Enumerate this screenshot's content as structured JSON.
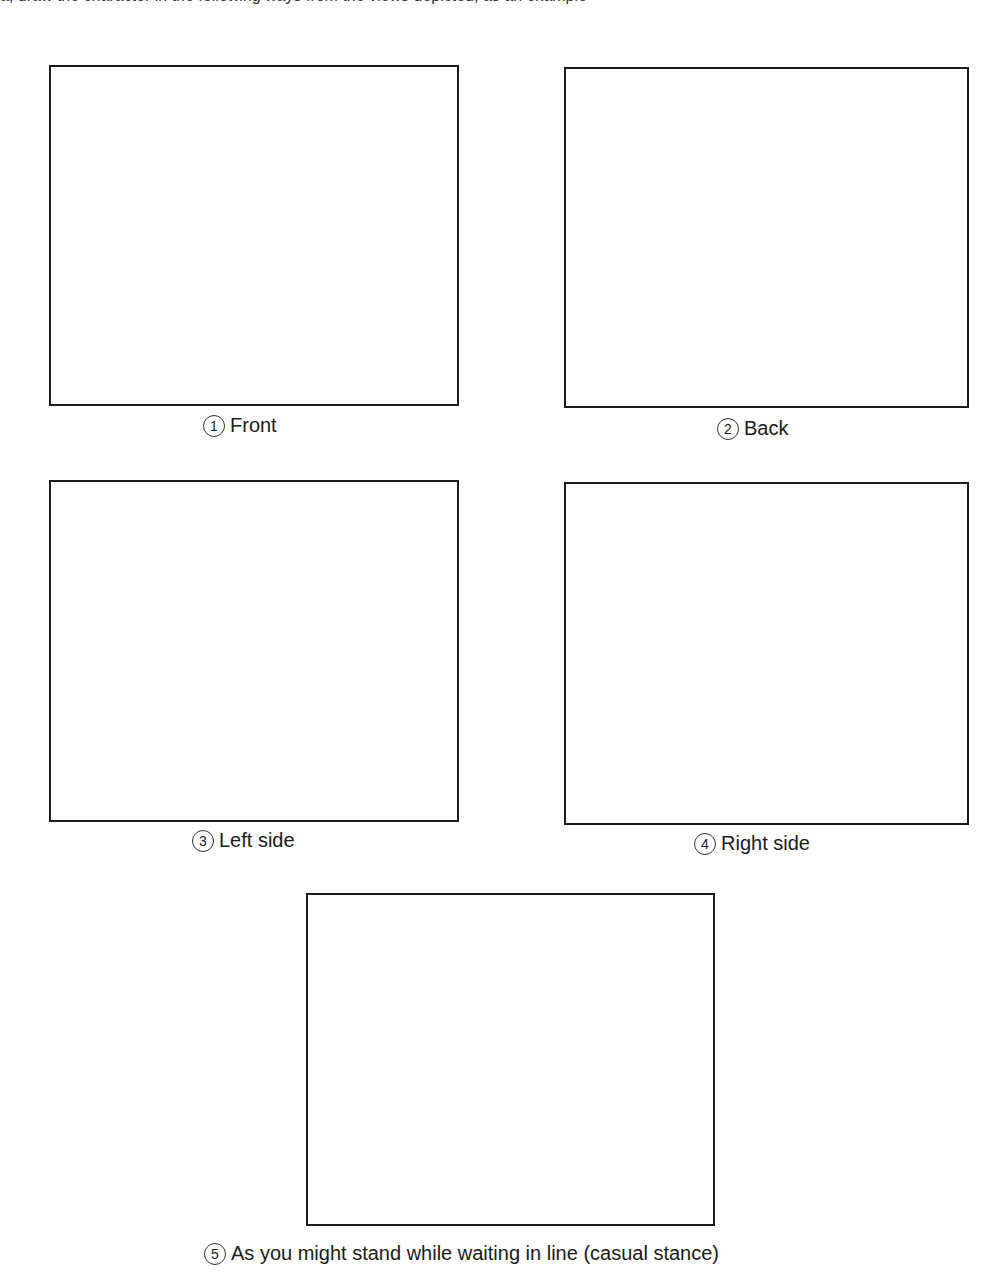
{
  "header": {
    "cut_off_text": "a, draw the character in the following ways from the views depicted, as an example"
  },
  "frames": [
    {
      "number": "1",
      "label": "Front"
    },
    {
      "number": "2",
      "label": "Back"
    },
    {
      "number": "3",
      "label": "Left side"
    },
    {
      "number": "4",
      "label": "Right side"
    },
    {
      "number": "5",
      "label": "As you might stand while waiting in line (casual stance)"
    }
  ]
}
